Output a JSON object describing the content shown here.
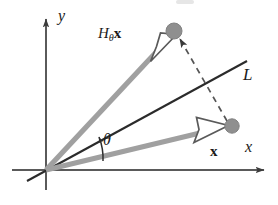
{
  "figure": {
    "width": 278,
    "height": 205,
    "background_color": "#ffffff"
  },
  "colors": {
    "axis": "#4a4a4a",
    "line_L": "#262626",
    "vector_gray": "#9a9a9a",
    "vector_outline": "#4a4a4a",
    "point_fill": "#8f8f8f",
    "point_stroke": "#7a7a7a",
    "dashed": "#555555",
    "text": "#1a1a1a"
  },
  "axes": [
    {
      "name": "y-axis",
      "label": "y",
      "orientation": "vertical",
      "arrow": "solid-up",
      "from": [
        46,
        190
      ],
      "to": [
        46,
        15
      ]
    },
    {
      "name": "x-axis",
      "label": "x",
      "orientation": "horizontal",
      "arrow": "solid-right",
      "from": [
        12,
        170
      ],
      "to": [
        268,
        170
      ]
    }
  ],
  "origin": [
    46,
    170
  ],
  "line": {
    "name": "L",
    "label": "L",
    "style": "solid",
    "from": [
      27,
      181
    ],
    "to": [
      247,
      61
    ]
  },
  "angle": {
    "label": "θ",
    "symbol_name": "theta",
    "description": "angle between vector x and line L",
    "arc_from_vector": "x",
    "arc_to_line": "L"
  },
  "vectors": [
    {
      "name": "H-theta-x",
      "label_head": "H",
      "label_subscript": "θ",
      "label_vector": "x",
      "label_full": "Hθx",
      "style": "gray-shaft-hollow-arrowhead",
      "from": [
        46,
        170
      ],
      "to": [
        174,
        33
      ],
      "endpoint_marker": "filled-circle"
    },
    {
      "name": "x",
      "label_full": "x",
      "style": "gray-shaft-hollow-arrowhead",
      "from": [
        46,
        170
      ],
      "to": [
        232,
        126
      ],
      "endpoint_marker": "filled-circle"
    }
  ],
  "connector": {
    "name": "reflection-dashed-line",
    "style": "dashed",
    "arrow": "solid-arrowhead-at-Hx-endpoint",
    "from": [
      228,
      123
    ],
    "to": [
      178,
      36
    ],
    "description": "dashed perpendicular from x endpoint to H-theta-x endpoint crossing line L"
  },
  "points": [
    {
      "name": "x-endpoint",
      "at": [
        232,
        126
      ],
      "radius": 7
    },
    {
      "name": "Hx-endpoint",
      "at": [
        174,
        31
      ],
      "radius": 8
    }
  ]
}
